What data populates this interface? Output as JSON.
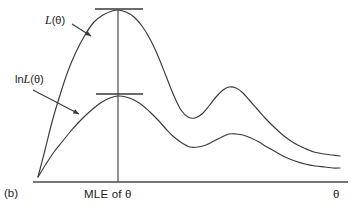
{
  "figure": {
    "panel_label": "(b)",
    "x_axis_title": "θ",
    "x_axis_tick_label": "MLE of θ",
    "background_color": "#ffffff",
    "line_color": "#3a3a3a",
    "axis_color": "#4a4a4a",
    "text_color": "#1a1a1a"
  },
  "annotations": {
    "likelihood": {
      "prefix": "",
      "symbol": "L",
      "argument": "(θ)",
      "full_text": "L(θ)"
    },
    "loglikelihood": {
      "prefix": "ln",
      "symbol": "L",
      "argument": "(θ)",
      "full_text": "lnL(θ)"
    }
  },
  "chart_data": {
    "type": "line",
    "title": "",
    "subtitle": "",
    "xlabel": "θ",
    "ylabel": "",
    "xlim": [
      0,
      358
    ],
    "ylim": [
      214,
      0
    ],
    "grid": false,
    "legend_position": "inline-annotations",
    "annotations": [
      {
        "text": "L(θ)",
        "label_xy": [
          50,
          22
        ],
        "arrow_from": [
          72,
          24
        ],
        "arrow_to": [
          91,
          36
        ],
        "target_series": "L(theta)"
      },
      {
        "text": "lnL(θ)",
        "label_xy": [
          18,
          80
        ],
        "arrow_from": [
          33,
          90
        ],
        "arrow_to": [
          79,
          114
        ],
        "target_series": "lnL(theta)"
      },
      {
        "text": "MLE of θ",
        "label_xy": [
          118,
          195
        ],
        "type": "x-axis-tick-label",
        "marks_x": 118
      },
      {
        "text": "θ",
        "label_xy": [
          337,
          195
        ],
        "type": "axis-title"
      },
      {
        "text": "(b)",
        "label_xy": [
          5,
          195
        ],
        "type": "panel-label"
      }
    ],
    "reference_lines": [
      {
        "name": "mle-vertical-line",
        "orientation": "vertical",
        "x": 118,
        "y_from": 10,
        "y_to": 182
      },
      {
        "name": "likelihood-peak-tangent",
        "orientation": "horizontal",
        "y": 9,
        "x_from": 95,
        "x_to": 143
      },
      {
        "name": "loglikelihood-peak-tangent",
        "orientation": "horizontal",
        "y": 94,
        "x_from": 96,
        "x_to": 143
      },
      {
        "name": "x-axis",
        "orientation": "horizontal",
        "y": 182,
        "x_from": 33,
        "x_to": 348
      }
    ],
    "series": [
      {
        "name": "L(theta)",
        "label": "L(θ)",
        "description": "likelihood function: steep rise from origin to global maximum at MLE, deep trough, secondary local maximum, long right tail",
        "peak_x": 118,
        "peak_y": 11,
        "points": [
          [
            38,
            177
          ],
          [
            45,
            150
          ],
          [
            52,
            122
          ],
          [
            60,
            95
          ],
          [
            68,
            71
          ],
          [
            76,
            52
          ],
          [
            85,
            35
          ],
          [
            94,
            22
          ],
          [
            103,
            15
          ],
          [
            112,
            11
          ],
          [
            118,
            10
          ],
          [
            126,
            12
          ],
          [
            134,
            17
          ],
          [
            142,
            26
          ],
          [
            150,
            39
          ],
          [
            158,
            56
          ],
          [
            166,
            76
          ],
          [
            174,
            96
          ],
          [
            181,
            110
          ],
          [
            188,
            117
          ],
          [
            195,
            118
          ],
          [
            202,
            114
          ],
          [
            209,
            106
          ],
          [
            216,
            97
          ],
          [
            223,
            90
          ],
          [
            229,
            87
          ],
          [
            236,
            88
          ],
          [
            243,
            93
          ],
          [
            250,
            101
          ],
          [
            258,
            110
          ],
          [
            266,
            119
          ],
          [
            275,
            128
          ],
          [
            284,
            136
          ],
          [
            294,
            143
          ],
          [
            304,
            148
          ],
          [
            314,
            152
          ],
          [
            324,
            154
          ],
          [
            332,
            155
          ],
          [
            340,
            156
          ]
        ]
      },
      {
        "name": "lnL(theta)",
        "label": "lnL(θ)",
        "description": "log-likelihood: same maximiser at MLE, flatter concave shape, shallower secondary bump, long right tail",
        "peak_x": 118,
        "peak_y": 96,
        "points": [
          [
            38,
            177
          ],
          [
            46,
            164
          ],
          [
            54,
            152
          ],
          [
            62,
            142
          ],
          [
            70,
            132
          ],
          [
            78,
            123
          ],
          [
            86,
            115
          ],
          [
            94,
            108
          ],
          [
            102,
            102
          ],
          [
            110,
            98
          ],
          [
            118,
            96
          ],
          [
            126,
            97
          ],
          [
            134,
            100
          ],
          [
            142,
            105
          ],
          [
            150,
            112
          ],
          [
            158,
            120
          ],
          [
            166,
            129
          ],
          [
            174,
            137
          ],
          [
            182,
            143
          ],
          [
            190,
            147
          ],
          [
            198,
            147
          ],
          [
            206,
            145
          ],
          [
            214,
            141
          ],
          [
            222,
            137
          ],
          [
            229,
            134
          ],
          [
            236,
            134
          ],
          [
            243,
            135
          ],
          [
            251,
            138
          ],
          [
            259,
            142
          ],
          [
            267,
            147
          ],
          [
            276,
            152
          ],
          [
            285,
            157
          ],
          [
            295,
            161
          ],
          [
            305,
            164
          ],
          [
            315,
            166
          ],
          [
            325,
            167
          ],
          [
            333,
            168
          ],
          [
            340,
            168
          ]
        ]
      }
    ]
  }
}
